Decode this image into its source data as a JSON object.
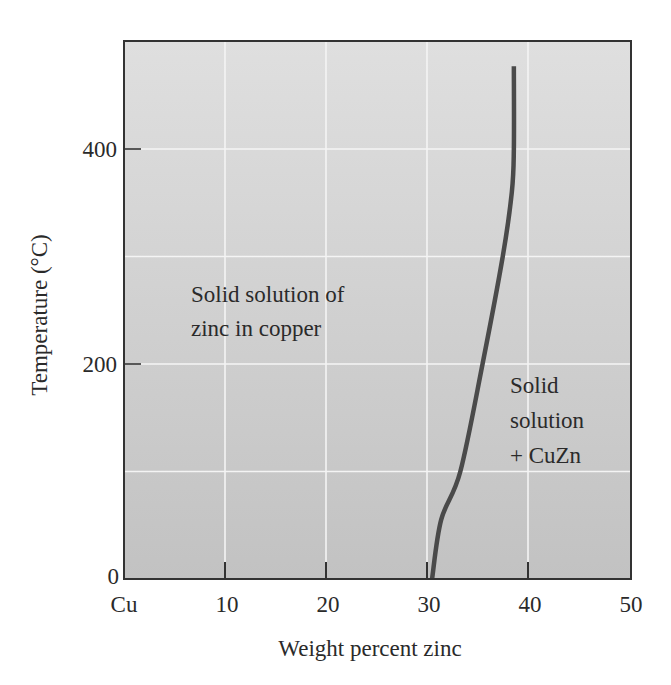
{
  "chart_data": {
    "type": "line",
    "title": "",
    "xlabel": "Weight percent zinc",
    "ylabel": "Temperature (°C)",
    "xlim": [
      0,
      50
    ],
    "ylim": [
      0,
      500
    ],
    "x_ticks": [
      0,
      10,
      20,
      30,
      40,
      50
    ],
    "x_tick_labels": [
      "Cu",
      "10",
      "20",
      "30",
      "40",
      "50"
    ],
    "y_ticks": [
      0,
      200,
      400
    ],
    "y_tick_labels": [
      "0",
      "200",
      "400"
    ],
    "grid": true,
    "grid_x": [
      10,
      20,
      30,
      40
    ],
    "grid_y": [
      100,
      200,
      300,
      400
    ],
    "legend": "none",
    "series": [
      {
        "name": "Solubility limit of zinc in copper",
        "x": [
          30.5,
          31.4,
          33.3,
          35.5,
          37.5,
          38.4,
          38.6,
          38.6
        ],
        "y": [
          0,
          55,
          100,
          200,
          300,
          360,
          400,
          477
        ]
      }
    ],
    "annotations": [
      {
        "text": [
          "Solid solution of",
          "zinc in copper"
        ],
        "x": 7,
        "y": 270
      },
      {
        "text": [
          "Solid",
          "solution",
          "+ CuZn"
        ],
        "x": 39,
        "y": 170
      }
    ],
    "colors": {
      "curve": "#4a4a4a",
      "background_top": "#dedede",
      "background_bottom": "#c3c3c3",
      "grid": "#f4f4f4",
      "axis": "#333333"
    }
  },
  "labels": {
    "xlabel": "Weight percent zinc",
    "ylabel": "Temperature (°C)",
    "x_ticks": [
      "Cu",
      "10",
      "20",
      "30",
      "40",
      "50"
    ],
    "y_ticks": [
      "0",
      "200",
      "400"
    ],
    "region_left_line1": "Solid solution of",
    "region_left_line2": "zinc in copper",
    "region_right_line1": "Solid",
    "region_right_line2": "solution",
    "region_right_line3": "+ CuZn"
  }
}
